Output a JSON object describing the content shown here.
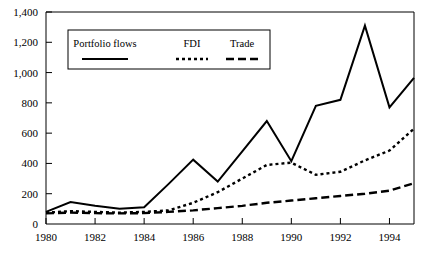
{
  "chart_data": {
    "type": "line",
    "title": "",
    "subtitle": "",
    "xlabel": "",
    "ylabel": "",
    "x": [
      1980,
      1981,
      1982,
      1983,
      1984,
      1985,
      1986,
      1987,
      1988,
      1989,
      1990,
      1991,
      1992,
      1993,
      1994,
      1995
    ],
    "xlim": [
      1980,
      1995
    ],
    "ylim": [
      0,
      1400
    ],
    "xticks": [
      1980,
      1982,
      1984,
      1986,
      1988,
      1990,
      1992,
      1994
    ],
    "xticklabels": [
      "1980",
      "1982",
      "1984",
      "1986",
      "1988",
      "1990",
      "1992",
      "1994"
    ],
    "yticks": [
      0,
      200,
      400,
      600,
      800,
      1000,
      1200,
      1400
    ],
    "yticklabels": [
      "0",
      "200",
      "400",
      "600",
      "800",
      "1,000",
      "1,200",
      "1,400"
    ],
    "grid": false,
    "legend_position": "upper-left-inside",
    "series": [
      {
        "name": "Portfolio flows",
        "style": "solid",
        "color": "#000000",
        "values": [
          80,
          145,
          120,
          100,
          110,
          265,
          425,
          280,
          480,
          680,
          415,
          780,
          820,
          1310,
          770,
          965
        ]
      },
      {
        "name": "FDI",
        "style": "dotted",
        "color": "#000000",
        "values": [
          75,
          85,
          80,
          75,
          80,
          90,
          140,
          210,
          300,
          390,
          405,
          325,
          345,
          420,
          485,
          630
        ]
      },
      {
        "name": "Trade",
        "style": "dashed",
        "color": "#000000",
        "values": [
          70,
          75,
          72,
          70,
          72,
          80,
          90,
          105,
          120,
          140,
          155,
          170,
          185,
          200,
          220,
          270
        ]
      }
    ]
  },
  "legend": {
    "entries": [
      {
        "label": "Portfolio flows",
        "style": "solid"
      },
      {
        "label": "FDI",
        "style": "dotted"
      },
      {
        "label": "Trade",
        "style": "dashed"
      }
    ]
  },
  "axes": {
    "y_axis_name": "value-axis",
    "x_axis_name": "year-axis"
  }
}
